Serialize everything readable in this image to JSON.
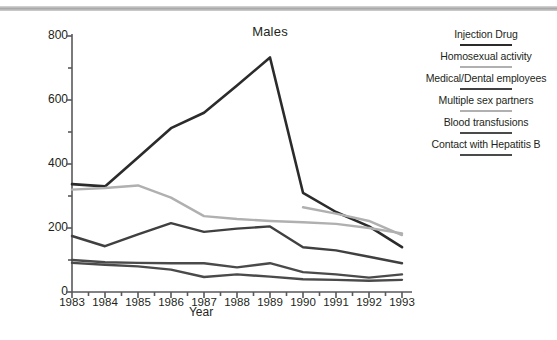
{
  "figure": {
    "title": "Males",
    "top_rule_color": "#a9a9a9",
    "background": "#ffffff"
  },
  "axes": {
    "y_label": "Number of cases",
    "x_label": "Year",
    "y_ticks": [
      "800",
      "600",
      "400",
      "200",
      "0"
    ],
    "y_tick_values": [
      800,
      600,
      400,
      200,
      0
    ],
    "y_minor_tick_values": [
      700,
      500,
      300,
      100
    ],
    "x_ticks": [
      "1983",
      "1984",
      "1985",
      "1986",
      "1987",
      "1988",
      "1989",
      "1990",
      "1991",
      "1992",
      "1993"
    ]
  },
  "legend": {
    "items": [
      {
        "label": "Injection Drug",
        "color": "#2b2b2b",
        "width": 2.6
      },
      {
        "label": "Homosexual activity",
        "color": "#b0b0b0",
        "width": 2.4
      },
      {
        "label": "Medical/Dental employees",
        "color": "#404040",
        "width": 2.4
      },
      {
        "label": "Multiple sex partners",
        "color": "#b0b0b0",
        "width": 2.4
      },
      {
        "label": "Blood transfusions",
        "color": "#4a4a4a",
        "width": 2.4
      },
      {
        "label": "Contact with Hepatitis B",
        "color": "#4a4a4a",
        "width": 2.4
      }
    ]
  },
  "chart_data": {
    "type": "line",
    "title": "Males",
    "xlabel": "Year",
    "ylabel": "Number of cases",
    "categories": [
      1983,
      1984,
      1985,
      1986,
      1987,
      1988,
      1989,
      1990,
      1991,
      1992,
      1993
    ],
    "xlim": [
      1983,
      1993
    ],
    "ylim": [
      0,
      800
    ],
    "grid": false,
    "legend_position": "right",
    "series": [
      {
        "name": "Injection Drug",
        "color": "#2b2b2b",
        "values": [
          337,
          330,
          420,
          512,
          560,
          645,
          733,
          310,
          250,
          205,
          140
        ]
      },
      {
        "name": "Homosexual activity",
        "color": "#b0b0b0",
        "values": [
          320,
          325,
          333,
          295,
          237,
          228,
          222,
          218,
          213,
          200,
          183
        ]
      },
      {
        "name": "Medical/Dental employees",
        "color": "#404040",
        "values": [
          175,
          143,
          180,
          215,
          188,
          198,
          205,
          140,
          130,
          110,
          90
        ]
      },
      {
        "name": "Multiple sex partners",
        "color": "#b0b0b0",
        "values": [
          null,
          null,
          null,
          null,
          null,
          null,
          null,
          265,
          245,
          222,
          178
        ]
      },
      {
        "name": "Blood transfusions",
        "color": "#4a4a4a",
        "values": [
          100,
          93,
          91,
          90,
          90,
          77,
          90,
          62,
          55,
          45,
          55
        ]
      },
      {
        "name": "Contact with Hepatitis B",
        "color": "#4a4a4a",
        "values": [
          91,
          85,
          80,
          70,
          47,
          55,
          48,
          40,
          38,
          35,
          38
        ]
      }
    ]
  }
}
